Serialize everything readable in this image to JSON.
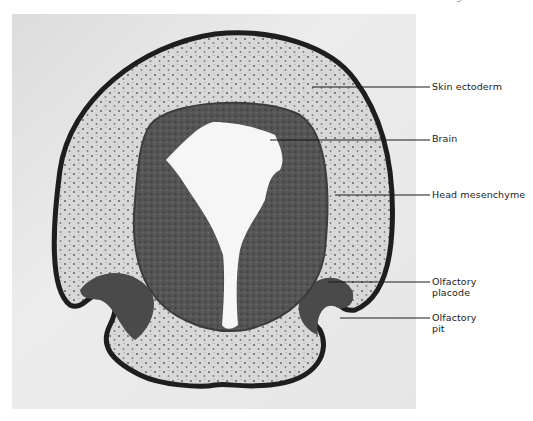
{
  "figure": {
    "page_mark": "9",
    "labels": [
      {
        "id": "skin-ectoderm",
        "text": "Skin ectoderm",
        "line2": ""
      },
      {
        "id": "brain",
        "text": "Brain",
        "line2": ""
      },
      {
        "id": "head-mesenchyme",
        "text": "Head mesenchyme",
        "line2": ""
      },
      {
        "id": "olfactory-placode",
        "text": "Olfactory",
        "line2": "placode"
      },
      {
        "id": "olfactory-pit",
        "text": "Olfactory",
        "line2": "pit"
      }
    ]
  }
}
